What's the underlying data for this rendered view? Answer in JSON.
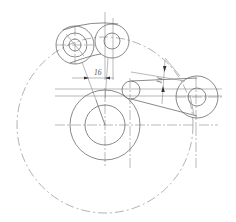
{
  "drawing": {
    "type": "mechanical linkage sketch",
    "colors": {
      "line": "#6b6b6b",
      "centerline": "#8a8a8a",
      "background": "#ffffff"
    },
    "dimensions": [
      {
        "id": "dim-horizontal",
        "label": "16"
      },
      {
        "id": "dim-angled",
        "label": "11"
      }
    ],
    "components": [
      "swing-path-circle",
      "main-hub",
      "top-left-eye",
      "top-right-eye",
      "small-roller",
      "right-pulley",
      "connecting-link"
    ],
    "caption": ""
  }
}
